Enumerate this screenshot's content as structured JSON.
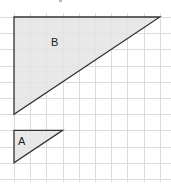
{
  "diagram": {
    "type": "similar-triangles-on-grid",
    "grid": {
      "cell_px": 16.2,
      "origin_x": 14,
      "origin_y": 17,
      "cols": 9,
      "rows": 10,
      "line_color": "#dcdcdc"
    },
    "shapes": [
      {
        "label": "B",
        "fill": "#e4e4e4",
        "stroke": "#333333",
        "vertices_grid": [
          [
            0,
            0
          ],
          [
            9,
            0
          ],
          [
            0,
            6
          ]
        ],
        "label_pos_px": [
          55,
          46
        ]
      },
      {
        "label": "A",
        "fill": "#e4e4e4",
        "stroke": "#333333",
        "vertices_grid": [
          [
            0,
            7
          ],
          [
            3,
            7
          ],
          [
            0,
            9
          ]
        ],
        "label_pos_px": [
          22,
          145
        ]
      }
    ],
    "labels": {
      "triangle_b": "B",
      "triangle_a": "A"
    }
  }
}
